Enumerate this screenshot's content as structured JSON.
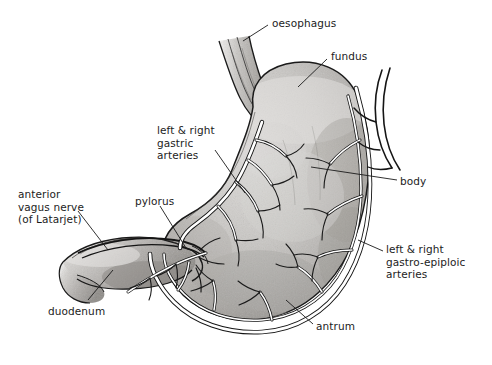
{
  "figure": {
    "type": "anatomical-illustration",
    "style": "grayscale pen-and-ink with wash shading",
    "background_color": "#ffffff",
    "ink_color": "#1a1a1a",
    "tissue_fill_light": "#cfcdca",
    "tissue_fill_mid": "#b3b0ad",
    "tissue_fill_dark": "#8f8c89",
    "vessel_fill": "#ffffff",
    "label_color": "#1c1c1c"
  },
  "labels": [
    {
      "id": "oesophagus",
      "text": "oesophagus",
      "x": 272,
      "y": 17,
      "align": "left"
    },
    {
      "id": "fundus",
      "text": "fundus",
      "x": 331,
      "y": 50,
      "align": "left"
    },
    {
      "id": "gastric-arteries",
      "text": "left & right\ngastric\narteries",
      "x": 157,
      "y": 124,
      "align": "left"
    },
    {
      "id": "body",
      "text": "body",
      "x": 400,
      "y": 175,
      "align": "left"
    },
    {
      "id": "vagus-nerve",
      "text": "anterior\nvagus nerve\n(of Latarjet)",
      "x": 18,
      "y": 188,
      "align": "left"
    },
    {
      "id": "pylorus",
      "text": "pylorus",
      "x": 135,
      "y": 195,
      "align": "left"
    },
    {
      "id": "gastro-epiploic-arteries",
      "text": "left & right\ngastro-epiploic\narteries",
      "x": 386,
      "y": 243,
      "align": "left"
    },
    {
      "id": "duodenum",
      "text": "duodenum",
      "x": 48,
      "y": 305,
      "align": "left"
    },
    {
      "id": "antrum",
      "text": "antrum",
      "x": 316,
      "y": 320,
      "align": "left"
    }
  ],
  "structures": [
    {
      "id": "oesophagus",
      "name": "oesophagus"
    },
    {
      "id": "fundus",
      "name": "fundus"
    },
    {
      "id": "body",
      "name": "body"
    },
    {
      "id": "antrum",
      "name": "antrum"
    },
    {
      "id": "pylorus",
      "name": "pylorus"
    },
    {
      "id": "duodenum",
      "name": "duodenum"
    },
    {
      "id": "gastric-arteries",
      "name": "left & right gastric arteries"
    },
    {
      "id": "gastro-epiploic-arteries",
      "name": "left & right gastro-epiploic arteries"
    },
    {
      "id": "vagus-nerve",
      "name": "anterior vagus nerve (of Latarjet)"
    }
  ]
}
